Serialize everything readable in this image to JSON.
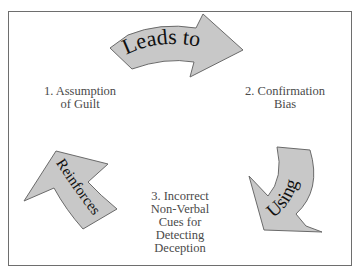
{
  "diagram": {
    "type": "cycle",
    "nodes": [
      {
        "id": "1",
        "label": "1. Assumption\nof Guilt"
      },
      {
        "id": "2",
        "label": "2. Confirmation\nBias"
      },
      {
        "id": "3",
        "label": "3. Incorrect\nNon-Verbal\nCues for\nDetecting\nDeception"
      }
    ],
    "edges": [
      {
        "from": "1",
        "to": "2",
        "label": "Leads to"
      },
      {
        "from": "2",
        "to": "3",
        "label": "Using"
      },
      {
        "from": "3",
        "to": "1",
        "label": "Reinforces"
      }
    ],
    "colors": {
      "arrow_fill": "#c8c8c8",
      "arrow_stroke": "#6a6a6a",
      "text": "#4a4a4a",
      "arrow_text": "#111111",
      "frame": "#6e6e6e"
    }
  }
}
